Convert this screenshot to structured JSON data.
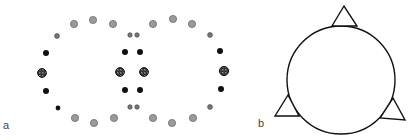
{
  "panels": {
    "a": {
      "label": "a",
      "label_pos": {
        "x": 3,
        "y": 120
      },
      "colors": {
        "gray": "#9a9a9a",
        "gray_stroke": "#6e6e6e",
        "black": "#111111",
        "mottled": "#3a3a3a"
      },
      "dots": [
        {
          "x": 74,
          "y": 24,
          "r": 3.6,
          "kind": "gray"
        },
        {
          "x": 93,
          "y": 20,
          "r": 3.6,
          "kind": "gray"
        },
        {
          "x": 113,
          "y": 24,
          "r": 3.6,
          "kind": "gray"
        },
        {
          "x": 57,
          "y": 36,
          "r": 2.4,
          "kind": "gray-dark"
        },
        {
          "x": 46,
          "y": 53,
          "r": 3.0,
          "kind": "black"
        },
        {
          "x": 42,
          "y": 73,
          "r": 4.4,
          "kind": "mottled"
        },
        {
          "x": 46,
          "y": 91,
          "r": 3.0,
          "kind": "black"
        },
        {
          "x": 58,
          "y": 108,
          "r": 2.4,
          "kind": "black"
        },
        {
          "x": 75,
          "y": 118,
          "r": 3.6,
          "kind": "gray"
        },
        {
          "x": 94,
          "y": 123,
          "r": 3.6,
          "kind": "gray"
        },
        {
          "x": 114,
          "y": 118,
          "r": 3.6,
          "kind": "gray"
        },
        {
          "x": 130,
          "y": 35,
          "r": 2.2,
          "kind": "gray-dark"
        },
        {
          "x": 137,
          "y": 35,
          "r": 2.2,
          "kind": "gray-dark"
        },
        {
          "x": 125,
          "y": 52,
          "r": 3.0,
          "kind": "black"
        },
        {
          "x": 140,
          "y": 52,
          "r": 3.0,
          "kind": "black"
        },
        {
          "x": 120,
          "y": 72,
          "r": 4.4,
          "kind": "mottled"
        },
        {
          "x": 144,
          "y": 72,
          "r": 4.4,
          "kind": "mottled"
        },
        {
          "x": 125,
          "y": 90,
          "r": 3.0,
          "kind": "black"
        },
        {
          "x": 140,
          "y": 90,
          "r": 3.0,
          "kind": "black"
        },
        {
          "x": 130,
          "y": 107,
          "r": 2.2,
          "kind": "gray-dark"
        },
        {
          "x": 137,
          "y": 107,
          "r": 2.2,
          "kind": "gray-dark"
        },
        {
          "x": 153,
          "y": 24,
          "r": 3.6,
          "kind": "gray"
        },
        {
          "x": 173,
          "y": 19,
          "r": 3.6,
          "kind": "gray"
        },
        {
          "x": 192,
          "y": 24,
          "r": 3.6,
          "kind": "gray"
        },
        {
          "x": 210,
          "y": 35,
          "r": 2.4,
          "kind": "gray-dark"
        },
        {
          "x": 220,
          "y": 51,
          "r": 3.0,
          "kind": "black"
        },
        {
          "x": 224,
          "y": 71,
          "r": 4.6,
          "kind": "mottled"
        },
        {
          "x": 221,
          "y": 89,
          "r": 3.0,
          "kind": "black"
        },
        {
          "x": 210,
          "y": 107,
          "r": 2.4,
          "kind": "gray-dark"
        },
        {
          "x": 153,
          "y": 118,
          "r": 3.6,
          "kind": "gray"
        },
        {
          "x": 172,
          "y": 123,
          "r": 3.6,
          "kind": "gray"
        },
        {
          "x": 193,
          "y": 118,
          "r": 3.6,
          "kind": "gray"
        }
      ]
    },
    "b": {
      "label": "b",
      "label_pos": {
        "x": 258,
        "y": 118
      },
      "circle": {
        "cx": 341,
        "cy": 80,
        "r": 54,
        "stroke": "#111111",
        "stroke_width": 1.4
      },
      "triangles": [
        {
          "name": "top",
          "points": "344,6 332,26 357,26"
        },
        {
          "name": "left",
          "points": "288,95 275,116 299,116"
        },
        {
          "name": "right",
          "points": "393,98 380,118 405,120"
        }
      ]
    }
  }
}
